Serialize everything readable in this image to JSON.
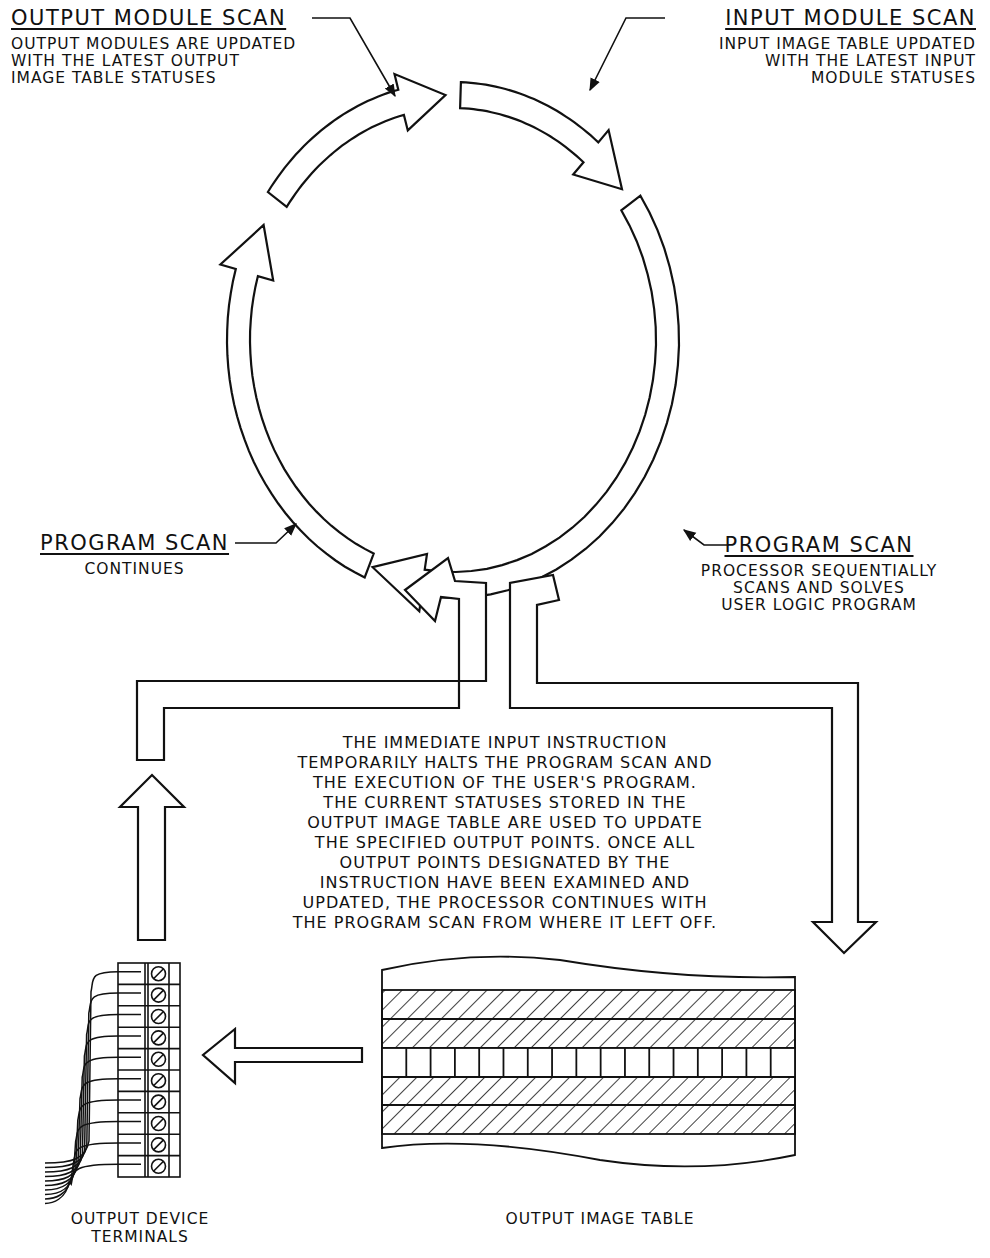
{
  "labels": {
    "output_module_scan": {
      "title": "OUTPUT MODULE SCAN",
      "lines": [
        "OUTPUT MODULES ARE UPDATED",
        "WITH THE LATEST OUTPUT",
        "IMAGE TABLE STATUSES"
      ]
    },
    "input_module_scan": {
      "title": "INPUT MODULE SCAN",
      "lines": [
        "INPUT IMAGE TABLE UPDATED",
        "WITH THE LATEST INPUT",
        "MODULE STATUSES"
      ]
    },
    "program_scan_left": {
      "title": "PROGRAM SCAN",
      "lines": [
        "CONTINUES"
      ]
    },
    "program_scan_right": {
      "title": "PROGRAM SCAN",
      "lines": [
        "PROCESSOR SEQUENTIALLY",
        "SCANS AND SOLVES",
        "USER LOGIC PROGRAM"
      ]
    }
  },
  "description": {
    "lines": [
      "THE IMMEDIATE INPUT INSTRUCTION",
      "TEMPORARILY HALTS THE PROGRAM SCAN AND",
      "THE EXECUTION OF THE USER'S PROGRAM.",
      "THE CURRENT STATUSES STORED IN THE",
      "OUTPUT IMAGE TABLE ARE USED TO UPDATE",
      "THE SPECIFIED OUTPUT POINTS.  ONCE ALL",
      "OUTPUT POINTS DESIGNATED BY THE",
      "INSTRUCTION HAVE BEEN EXAMINED AND",
      "UPDATED, THE PROCESSOR CONTINUES WITH",
      "THE PROGRAM SCAN FROM WHERE IT LEFT OFF."
    ]
  },
  "captions": {
    "terminals": [
      "OUTPUT DEVICE",
      "TERMINALS"
    ],
    "image_table": "OUTPUT IMAGE TABLE"
  },
  "terminal_block": {
    "terminal_count": 10
  },
  "image_table": {
    "hatched_rows": 4,
    "bit_cells": 17
  },
  "colors": {
    "line": "#111111",
    "background": "#ffffff"
  }
}
